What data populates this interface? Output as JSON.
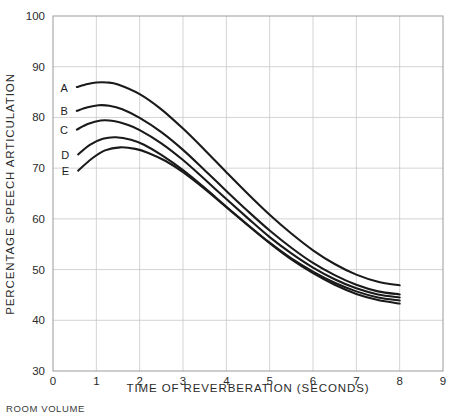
{
  "chart_data": {
    "type": "line",
    "title": "",
    "xlabel": "TIME OF REVERBERATION (SECONDS)",
    "ylabel": "PERCENTAGE SPEECH ARTICULATION",
    "footnote": "ROOM VOLUME",
    "xlim": [
      0,
      9
    ],
    "ylim": [
      30,
      100
    ],
    "xticks": [
      "0",
      "1",
      "2",
      "3",
      "4",
      "5",
      "6",
      "7",
      "8",
      "9"
    ],
    "yticks": [
      "30",
      "40",
      "50",
      "60",
      "70",
      "80",
      "90",
      "100"
    ],
    "grid": true,
    "legend_position": "inline-left",
    "series": [
      {
        "name": "A",
        "label": "A",
        "color": "#1a1a1a",
        "points": [
          [
            0.55,
            86.0
          ],
          [
            0.8,
            86.6
          ],
          [
            1.0,
            86.9
          ],
          [
            1.25,
            86.9
          ],
          [
            1.5,
            86.5
          ],
          [
            2.0,
            84.6
          ],
          [
            2.5,
            81.6
          ],
          [
            3.0,
            77.8
          ],
          [
            3.5,
            73.6
          ],
          [
            4.0,
            69.2
          ],
          [
            4.5,
            64.9
          ],
          [
            5.0,
            60.8
          ],
          [
            5.5,
            57.1
          ],
          [
            6.0,
            53.8
          ],
          [
            6.5,
            51.1
          ],
          [
            7.0,
            49.0
          ],
          [
            7.5,
            47.6
          ],
          [
            8.0,
            46.9
          ]
        ]
      },
      {
        "name": "B",
        "label": "B",
        "color": "#1a1a1a",
        "points": [
          [
            0.55,
            81.3
          ],
          [
            0.8,
            82.0
          ],
          [
            1.05,
            82.4
          ],
          [
            1.3,
            82.3
          ],
          [
            1.6,
            81.6
          ],
          [
            2.0,
            79.9
          ],
          [
            2.5,
            77.1
          ],
          [
            3.0,
            73.6
          ],
          [
            3.5,
            69.6
          ],
          [
            4.0,
            65.5
          ],
          [
            4.5,
            61.5
          ],
          [
            5.0,
            57.7
          ],
          [
            5.5,
            54.3
          ],
          [
            6.0,
            51.3
          ],
          [
            6.5,
            48.9
          ],
          [
            7.0,
            47.0
          ],
          [
            7.5,
            45.7
          ],
          [
            8.0,
            45.1
          ]
        ]
      },
      {
        "name": "C",
        "label": "C",
        "color": "#1a1a1a",
        "points": [
          [
            0.55,
            77.6
          ],
          [
            0.8,
            78.7
          ],
          [
            1.1,
            79.4
          ],
          [
            1.4,
            79.3
          ],
          [
            1.7,
            78.6
          ],
          [
            2.0,
            77.5
          ],
          [
            2.5,
            74.9
          ],
          [
            3.0,
            71.6
          ],
          [
            3.5,
            67.8
          ],
          [
            4.0,
            63.9
          ],
          [
            4.5,
            60.1
          ],
          [
            5.0,
            56.4
          ],
          [
            5.5,
            53.2
          ],
          [
            6.0,
            50.4
          ],
          [
            6.5,
            48.1
          ],
          [
            7.0,
            46.3
          ],
          [
            7.5,
            45.1
          ],
          [
            8.0,
            44.5
          ]
        ]
      },
      {
        "name": "D",
        "label": "D",
        "color": "#1a1a1a",
        "points": [
          [
            0.58,
            72.7
          ],
          [
            0.85,
            74.6
          ],
          [
            1.15,
            75.8
          ],
          [
            1.45,
            76.1
          ],
          [
            1.8,
            75.6
          ],
          [
            2.1,
            74.6
          ],
          [
            2.5,
            72.6
          ],
          [
            3.0,
            69.6
          ],
          [
            3.5,
            66.1
          ],
          [
            4.0,
            62.4
          ],
          [
            4.5,
            58.8
          ],
          [
            5.0,
            55.3
          ],
          [
            5.5,
            52.2
          ],
          [
            6.0,
            49.6
          ],
          [
            6.5,
            47.4
          ],
          [
            7.0,
            45.7
          ],
          [
            7.5,
            44.5
          ],
          [
            8.0,
            43.9
          ]
        ]
      },
      {
        "name": "E",
        "label": "E",
        "color": "#1a1a1a",
        "points": [
          [
            0.58,
            69.5
          ],
          [
            0.9,
            71.9
          ],
          [
            1.2,
            73.5
          ],
          [
            1.55,
            74.1
          ],
          [
            1.9,
            73.8
          ],
          [
            2.2,
            73.0
          ],
          [
            2.6,
            71.4
          ],
          [
            3.0,
            69.2
          ],
          [
            3.5,
            65.9
          ],
          [
            4.0,
            62.3
          ],
          [
            4.5,
            58.7
          ],
          [
            5.0,
            55.2
          ],
          [
            5.5,
            52.0
          ],
          [
            6.0,
            49.3
          ],
          [
            6.5,
            47.0
          ],
          [
            7.0,
            45.2
          ],
          [
            7.5,
            44.0
          ],
          [
            8.0,
            43.3
          ]
        ]
      }
    ]
  }
}
